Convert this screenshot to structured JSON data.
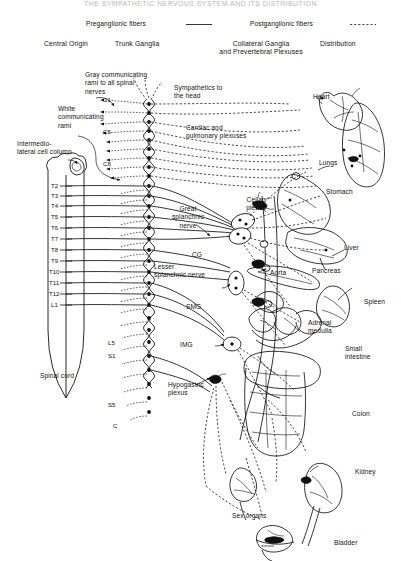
{
  "figure": {
    "title_cropped": "THE SYMPATHETIC NERVOUS SYSTEM AND ITS DISTRIBUTION",
    "background_color": "#ffffff",
    "ink_color": "#111111"
  },
  "legend": {
    "preganglionic": "Preganglionic fibers",
    "preganglionic_style": "solid",
    "postganglionic": "Postganglionic fibers",
    "postganglionic_style": "dashed"
  },
  "columns": [
    {
      "label": "Central Origin"
    },
    {
      "label": "Trunk Ganglia"
    },
    {
      "label": "Collateral Ganglia\nand Prevertebral Plexuses"
    },
    {
      "label": "Distribution"
    }
  ],
  "annotations": {
    "gray_rami": "Gray communicating\nrami to all spinal\nnerves",
    "white_rami": "White\ncommunicating\nrami",
    "intermediolateral": "Intermedio-\nlateral cell column",
    "spinal_cord": "Spinal cord",
    "sympathetics_head": "Sympathetics to\nthe head",
    "cardiac_pulmonary": "Cardiac and\npulmonary plexuses",
    "great_splanchnic": "Great\nsplanchnic\nnerve",
    "lesser_splanchnic": "Lesser\nsplanchnic nerve",
    "celiac_plexus": "Celiac\nplexus",
    "hypogastric_plexus": "Hypogastric\nplexus",
    "aorta": "Aorta"
  },
  "ganglia": {
    "celiac": "CG",
    "superior_mesenteric": "SMG",
    "inferior_mesenteric": "IMG"
  },
  "spinal_segments": {
    "cervical": [
      "C1",
      "C5",
      "C8"
    ],
    "thoracolumbar": [
      "T2",
      "T3",
      "T4",
      "T5",
      "T6",
      "T7",
      "T8",
      "T9",
      "T10",
      "T11",
      "T12",
      "L1"
    ],
    "lumbosacral": [
      "L5",
      "S1"
    ],
    "sacral_coccygeal": [
      "S5",
      "C"
    ]
  },
  "organs": [
    {
      "label": "Heart"
    },
    {
      "label": "Lungs"
    },
    {
      "label": "Stomach"
    },
    {
      "label": "Liver"
    },
    {
      "label": "Pancreas"
    },
    {
      "label": "Spleen"
    },
    {
      "label": "Adrenal\nmedulla"
    },
    {
      "label": "Small\nintestine"
    },
    {
      "label": "Colon"
    },
    {
      "label": "Kidney"
    },
    {
      "label": "Sex organs"
    },
    {
      "label": "Bladder"
    }
  ]
}
